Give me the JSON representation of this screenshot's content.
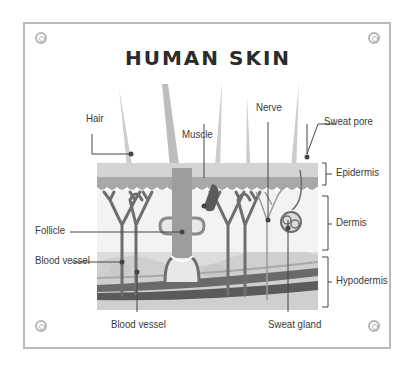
{
  "title": "HUMAN SKIN",
  "labels": {
    "hair": "Hair",
    "muscle": "Muscle",
    "nerve": "Nerve",
    "sweat_pore": "Sweat pore",
    "epidermis": "Epidermis",
    "dermis": "Dermis",
    "hypodermis": "Hypodermis",
    "follicle": "Follicle",
    "blood_vessel_left": "Blood vessel",
    "blood_vessel_bottom": "Blood vessel",
    "sweat_gland": "Sweat gland"
  },
  "colors": {
    "frame": "#b9b9b9",
    "epidermis_top": "#cfcfcf",
    "epidermis_band": "#a9a9a9",
    "dermis": "#f2f2f2",
    "hypodermis": "#d9d9d9",
    "vessel_dark": "#5a5a5a",
    "hair": "#c8c8c8",
    "leader_line": "#444444"
  }
}
